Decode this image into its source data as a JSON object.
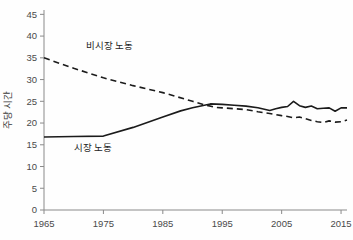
{
  "chart_data": {
    "type": "line",
    "title": "",
    "xlabel": "",
    "ylabel": "주당 시간",
    "xlim": [
      1965,
      2016
    ],
    "ylim": [
      0,
      46
    ],
    "grid": false,
    "legend_position": "inline-annotation",
    "xticks": [
      1965,
      1975,
      1985,
      1995,
      2005,
      2015
    ],
    "yticks": [
      0,
      5,
      10,
      15,
      20,
      25,
      30,
      35,
      40,
      45
    ],
    "annotations": [
      {
        "text": "비시장 노동",
        "x": 1972,
        "y": 37.0
      },
      {
        "text": "시장 노동",
        "x": 1970,
        "y": 13.5
      }
    ],
    "series": [
      {
        "name": "시장 노동",
        "style": "solid",
        "color": "#1b1b1b",
        "x": [
          1965,
          1970,
          1975,
          1980,
          1985,
          1988,
          1990,
          1992,
          1993,
          1995,
          1997,
          1999,
          2001,
          2003,
          2004,
          2005,
          2006,
          2007,
          2008,
          2009,
          2010,
          2011,
          2012,
          2013,
          2014,
          2015,
          2016
        ],
        "values": [
          16.8,
          16.9,
          17.0,
          19.0,
          21.4,
          22.8,
          23.5,
          24.1,
          24.4,
          24.3,
          24.1,
          23.9,
          23.5,
          22.9,
          23.3,
          23.6,
          23.8,
          25.0,
          24.0,
          23.6,
          23.9,
          23.3,
          23.4,
          23.5,
          22.7,
          23.5,
          23.5
        ]
      },
      {
        "name": "비시장 노동",
        "style": "dashed",
        "color": "#1b1b1b",
        "x": [
          1965,
          1970,
          1975,
          1980,
          1985,
          1990,
          1992,
          1994,
          1995,
          1997,
          1999,
          2001,
          2003,
          2005,
          2006,
          2007,
          2008,
          2009,
          2010,
          2011,
          2012,
          2013,
          2014,
          2015,
          2016
        ],
        "values": [
          35.0,
          32.6,
          30.4,
          28.6,
          27.0,
          25.0,
          24.2,
          23.6,
          23.5,
          23.3,
          23.1,
          22.6,
          22.2,
          21.7,
          21.5,
          21.2,
          21.4,
          21.0,
          20.6,
          20.3,
          20.1,
          20.5,
          20.2,
          20.3,
          20.7
        ]
      }
    ]
  },
  "y_axis": {
    "title": "주당 시간"
  },
  "labels": {
    "market_labor": "시장 노동",
    "nonmarket_labor": "비시장 노동"
  }
}
